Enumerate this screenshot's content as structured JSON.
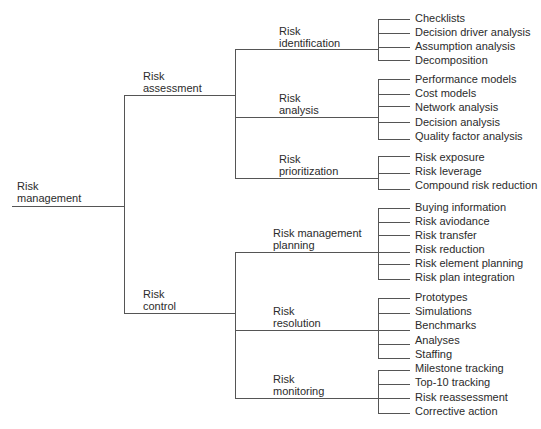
{
  "diagram": {
    "type": "tree",
    "root": {
      "line1": "Risk",
      "line2": "management"
    },
    "level1": [
      {
        "line1": "Risk",
        "line2": "assessment",
        "children": [
          {
            "line1": "Risk",
            "line2": "identification",
            "leaves": [
              "Checklists",
              "Decision driver analysis",
              "Assumption analysis",
              "Decomposition"
            ]
          },
          {
            "line1": "Risk",
            "line2": "analysis",
            "leaves": [
              "Performance models",
              "Cost models",
              "Network analysis",
              "Decision analysis",
              "Quality factor analysis"
            ]
          },
          {
            "line1": "Risk",
            "line2": "prioritization",
            "leaves": [
              "Risk exposure",
              "Risk leverage",
              "Compound risk reduction"
            ]
          }
        ]
      },
      {
        "line1": "Risk",
        "line2": "control",
        "children": [
          {
            "line1": "Risk management",
            "line2": "planning",
            "leaves": [
              "Buying information",
              "Risk aviodance",
              "Risk transfer",
              "Risk reduction",
              "Risk element planning",
              "Risk plan integration"
            ]
          },
          {
            "line1": "Risk",
            "line2": "resolution",
            "leaves": [
              "Prototypes",
              "Simulations",
              "Benchmarks",
              "Analyses",
              "Staffing"
            ]
          },
          {
            "line1": "Risk",
            "line2": "monitoring",
            "leaves": [
              "Milestone tracking",
              "Top-10 tracking",
              "Risk reassessment",
              "Corrective action"
            ]
          }
        ]
      }
    ]
  },
  "colors": {
    "line": "#555555",
    "text": "#2b2b2b",
    "background": "#ffffff"
  }
}
